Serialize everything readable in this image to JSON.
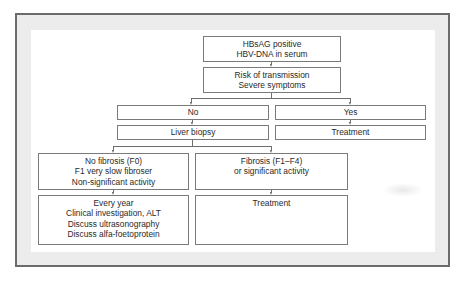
{
  "diagram": {
    "type": "flowchart",
    "nodes": {
      "start": {
        "lines": [
          "HBsAG positive",
          "HBV-DNA in serum"
        ]
      },
      "risk": {
        "lines": [
          "Risk of transmission",
          "Severe symptoms"
        ]
      },
      "no": {
        "lines": [
          "No"
        ]
      },
      "yes": {
        "lines": [
          "Yes"
        ]
      },
      "biopsy": {
        "lines": [
          "Liver biopsy"
        ]
      },
      "treatment_yes": {
        "lines": [
          "Treatment"
        ]
      },
      "no_fibrosis": {
        "lines": [
          "No fibrosis (F0)",
          "F1 very slow fibroser",
          "Non-significant activity"
        ]
      },
      "fibrosis": {
        "lines": [
          "Fibrosis (F1–F4)",
          "or significant activity"
        ]
      },
      "followup": {
        "lines": [
          "Every year",
          "Clinical investigation, ALT",
          "Discuss ultrasonography",
          "Discuss alfa-foetoprotein"
        ]
      },
      "treatment_fibrosis": {
        "lines": [
          "Treatment"
        ]
      }
    },
    "edges": [
      [
        "start",
        "risk"
      ],
      [
        "risk",
        "no"
      ],
      [
        "risk",
        "yes"
      ],
      [
        "no",
        "biopsy"
      ],
      [
        "yes",
        "treatment_yes"
      ],
      [
        "biopsy",
        "no_fibrosis"
      ],
      [
        "biopsy",
        "fibrosis"
      ],
      [
        "no_fibrosis",
        "followup"
      ],
      [
        "fibrosis",
        "treatment_fibrosis"
      ]
    ],
    "colors": {
      "frame_border": "#6b6b6b",
      "frame_fill": "#ececec",
      "box_border": "#7a7a7a",
      "text": "#2a2a2a"
    }
  }
}
